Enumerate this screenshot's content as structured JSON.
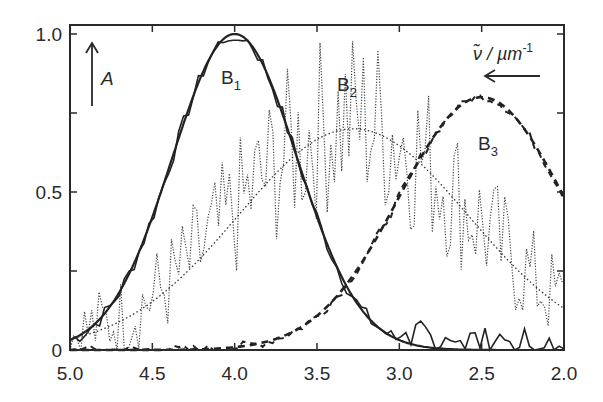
{
  "chart_data": {
    "type": "line",
    "title": "",
    "xlabel": "ν̃ / µm⁻¹",
    "ylabel": "A",
    "xlim": [
      5.0,
      2.0
    ],
    "ylim": [
      0,
      1.0
    ],
    "x_reversed": true,
    "grid": false,
    "legend": "none (inline labels B1, B2, B3)",
    "x_ticks": [
      "5.0",
      "4.5",
      "4.0",
      "3.5",
      "3.0",
      "2.5",
      "2.0"
    ],
    "x_tick_values": [
      5.0,
      4.5,
      4.0,
      3.5,
      3.0,
      2.5,
      2.0
    ],
    "y_ticks": [
      "0",
      "0.5",
      "1.0"
    ],
    "y_tick_values": [
      0,
      0.5,
      1.0
    ],
    "annotations": [
      {
        "text": "A",
        "note": "upward arrow, ordinate direction"
      },
      {
        "text": "ν̃ / µm⁻¹",
        "note": "leftward arrow, abscissa direction"
      }
    ],
    "series": [
      {
        "name": "B1",
        "style": "solid",
        "fit": {
          "type": "gaussian",
          "center": 4.0,
          "amplitude": 1.0,
          "sigma": 0.38
        },
        "x": [
          5.0,
          4.8,
          4.6,
          4.5,
          4.4,
          4.3,
          4.2,
          4.1,
          4.0,
          3.9,
          3.8,
          3.7,
          3.6,
          3.5,
          3.4,
          3.3,
          3.2,
          3.1,
          3.0,
          2.8,
          2.5,
          2.0
        ],
        "values": [
          0.04,
          0.11,
          0.29,
          0.42,
          0.58,
          0.73,
          0.87,
          0.97,
          1.0,
          0.97,
          0.87,
          0.73,
          0.58,
          0.42,
          0.29,
          0.18,
          0.11,
          0.06,
          0.03,
          0.01,
          0.0,
          0.0
        ]
      },
      {
        "name": "B2",
        "style": "dotted",
        "fit": {
          "type": "gaussian",
          "center": 3.28,
          "amplitude": 0.7,
          "sigma": 0.7
        },
        "x": [
          5.0,
          4.75,
          4.5,
          4.25,
          4.0,
          3.75,
          3.5,
          3.28,
          3.0,
          2.75,
          2.5,
          2.25,
          2.0
        ],
        "values": [
          0.04,
          0.08,
          0.15,
          0.27,
          0.41,
          0.56,
          0.67,
          0.7,
          0.65,
          0.53,
          0.38,
          0.24,
          0.13
        ]
      },
      {
        "name": "B3",
        "style": "dashed",
        "fit": {
          "type": "gaussian",
          "center": 2.5,
          "amplitude": 0.8,
          "sigma": 0.5
        },
        "x": [
          5.0,
          4.5,
          4.0,
          3.75,
          3.5,
          3.25,
          3.0,
          2.75,
          2.5,
          2.25,
          2.0
        ],
        "values": [
          0.0,
          0.0,
          0.01,
          0.04,
          0.11,
          0.26,
          0.49,
          0.7,
          0.8,
          0.7,
          0.49
        ]
      }
    ]
  },
  "labels": {
    "b1": "B",
    "b1_sub": "1",
    "b2": "B",
    "b2_sub": "2",
    "b3": "B",
    "b3_sub": "3",
    "a_axis": "A",
    "nu_axis_main": "ν̃ / µm",
    "nu_axis_sup": "-1"
  }
}
